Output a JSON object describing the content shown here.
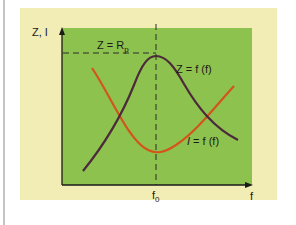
{
  "diagram": {
    "y_axis_label": "Z, I",
    "x_axis_label": "f",
    "x_marker_label": "f0",
    "x_marker_main": "f",
    "x_marker_sub": "0",
    "ref_line_label_main": "Z = R",
    "ref_line_label_sub": "p",
    "curves": [
      {
        "name": "impedance",
        "label": "Z = f (f)",
        "color": "#4b2a3c",
        "shape": "peak at f0"
      },
      {
        "name": "current",
        "label_italic": "I",
        "label_rest": " = f (f)",
        "color": "#d2551a",
        "shape": "minimum at f0"
      }
    ],
    "colors": {
      "frame": "#f1edb4",
      "plot_area": "#8ec24e",
      "axis": "#1a1a1a",
      "dash": "#2a2a2a"
    }
  }
}
